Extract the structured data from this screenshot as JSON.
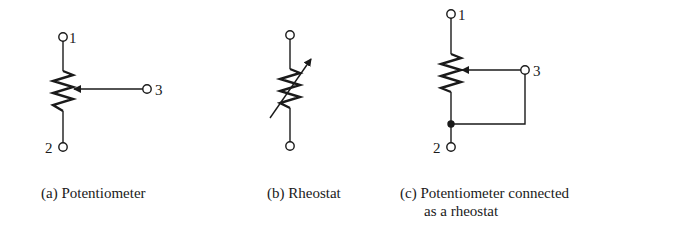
{
  "diagrams": [
    {
      "id": "a",
      "caption": "(a) Potentiometer",
      "terminals": {
        "t1": "1",
        "t2": "2",
        "t3": "3"
      }
    },
    {
      "id": "b",
      "caption": "(b) Rheostat"
    },
    {
      "id": "c",
      "caption_line1": "(c) Potentiometer connected",
      "caption_line2": "as a rheostat",
      "terminals": {
        "t1": "1",
        "t2": "2",
        "t3": "3"
      }
    }
  ],
  "colors": {
    "ink": "#1a1a1a",
    "background": "#ffffff"
  }
}
